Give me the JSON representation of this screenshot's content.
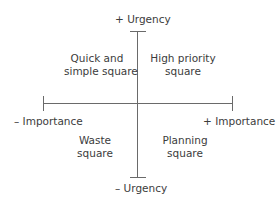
{
  "axes": {
    "vertical": {
      "top_label": "+ Urgency",
      "bottom_label": "– Urgency"
    },
    "horizontal": {
      "left_label": "– Importance",
      "right_label": "+ Importance"
    }
  },
  "quadrants": {
    "top_left": {
      "line1": "Quick and",
      "line2": "simple square"
    },
    "top_right": {
      "line1": "High priority",
      "line2": "square"
    },
    "bottom_left": {
      "line1": "Waste",
      "line2": "square"
    },
    "bottom_right": {
      "line1": "Planning",
      "line2": "square"
    }
  },
  "colors": {
    "line": "#6a6a6a",
    "text": "#3c3c3c",
    "background": "#ffffff"
  }
}
